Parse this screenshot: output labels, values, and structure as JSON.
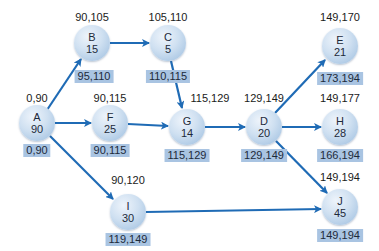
{
  "colors": {
    "arrow": "#1f6bb5",
    "node_fill": "#c3d8ee",
    "label_box": "#a9c4e2"
  },
  "nodes": {
    "A": {
      "name": "A",
      "duration": "90",
      "top": "0,90",
      "bottom": "0,90"
    },
    "B": {
      "name": "B",
      "duration": "15",
      "top": "90,105",
      "bottom": "95,110"
    },
    "C": {
      "name": "C",
      "duration": "5",
      "top": "105,110",
      "bottom": "110,115"
    },
    "F": {
      "name": "F",
      "duration": "25",
      "top": "90,115",
      "bottom": "90,115"
    },
    "G": {
      "name": "G",
      "duration": "14",
      "top": "115,129",
      "bottom": "115,129"
    },
    "D": {
      "name": "D",
      "duration": "20",
      "top": "129,149",
      "bottom": "129,149"
    },
    "E": {
      "name": "E",
      "duration": "21",
      "top": "149,170",
      "bottom": "173,194"
    },
    "H": {
      "name": "H",
      "duration": "28",
      "top": "149,177",
      "bottom": "166,194"
    },
    "I": {
      "name": "I",
      "duration": "30",
      "top": "90,120",
      "bottom": "119,149"
    },
    "J": {
      "name": "J",
      "duration": "45",
      "top": "149,194",
      "bottom": "149,194"
    }
  },
  "edges": [
    [
      "A",
      "B"
    ],
    [
      "A",
      "F"
    ],
    [
      "A",
      "I"
    ],
    [
      "B",
      "C"
    ],
    [
      "C",
      "G"
    ],
    [
      "F",
      "G"
    ],
    [
      "G",
      "D"
    ],
    [
      "D",
      "E"
    ],
    [
      "D",
      "H"
    ],
    [
      "D",
      "J"
    ],
    [
      "I",
      "J"
    ]
  ]
}
